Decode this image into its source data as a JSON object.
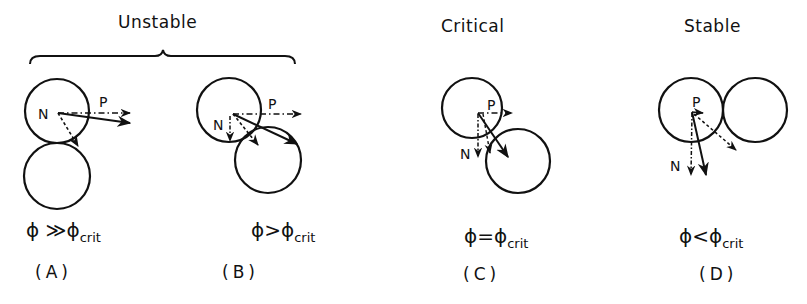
{
  "headers": {
    "unstable": "Unstable",
    "critical": "Critical",
    "stable": "Stable"
  },
  "panels": [
    {
      "id": "(A)",
      "condition_lhs": "ϕ",
      "condition_op": "≫",
      "condition_rhs": "ϕ",
      "condition_sub": "crit",
      "force_labels": {
        "p": "P",
        "n": "N"
      }
    },
    {
      "id": "(B)",
      "condition_lhs": "ϕ",
      "condition_op": ">",
      "condition_rhs": "ϕ",
      "condition_sub": "crit",
      "force_labels": {
        "p": "P",
        "n": "N"
      }
    },
    {
      "id": "(C)",
      "condition_lhs": "ϕ",
      "condition_op": "=",
      "condition_rhs": "ϕ",
      "condition_sub": "crit",
      "force_labels": {
        "p": "P",
        "n": "N"
      }
    },
    {
      "id": "(D)",
      "condition_lhs": "ϕ",
      "condition_op": "<",
      "condition_rhs": "ϕ",
      "condition_sub": "crit",
      "force_labels": {
        "p": "P",
        "n": "N"
      }
    }
  ],
  "colors": {
    "ink": "#111111",
    "background": "#ffffff"
  }
}
